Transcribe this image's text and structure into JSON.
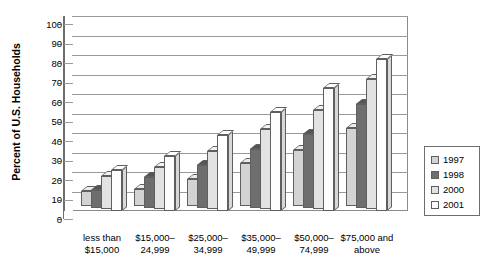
{
  "chart_data": {
    "type": "bar",
    "title": "",
    "subtitle": "",
    "xlabel": "",
    "ylabel": "Percent of U.S. Households",
    "ylim": [
      0,
      100
    ],
    "ytick_step": 10,
    "yticks": [
      "100",
      "90",
      "80",
      "70",
      "60",
      "50",
      "40",
      "30",
      "20",
      "10",
      "0"
    ],
    "grid": true,
    "legend_position": "right",
    "categories": [
      "less than\n$15,000",
      "$15,000–\n24,999",
      "$25,000–\n34,999",
      "$35,000–\n49,999",
      "$50,000–\n74,999",
      "$75,000 and\nabove"
    ],
    "category_lines": [
      [
        "less than",
        "$15,000"
      ],
      [
        "$15,000–",
        "24,999"
      ],
      [
        "$25,000–",
        "34,999"
      ],
      [
        "$35,000–",
        "49,999"
      ],
      [
        "$50,000–",
        "74,999"
      ],
      [
        "$75,000 and",
        "above"
      ]
    ],
    "series": [
      {
        "name": "1997",
        "color": "#d3d3d3",
        "values": [
          8,
          9,
          14,
          22,
          29,
          40
        ]
      },
      {
        "name": "1998",
        "color": "#6e6e6e",
        "values": [
          9,
          16,
          22,
          30,
          38,
          53
        ]
      },
      {
        "name": "2000",
        "color": "#e2e2e2",
        "values": [
          17,
          22,
          30,
          41,
          51,
          67
        ]
      },
      {
        "name": "2001",
        "color": "#fdfdfd",
        "values": [
          21,
          28,
          39,
          51,
          63,
          78
        ]
      }
    ]
  },
  "legend": {
    "items": [
      {
        "label": "1997"
      },
      {
        "label": "1998"
      },
      {
        "label": "2000"
      },
      {
        "label": "2001"
      }
    ]
  }
}
